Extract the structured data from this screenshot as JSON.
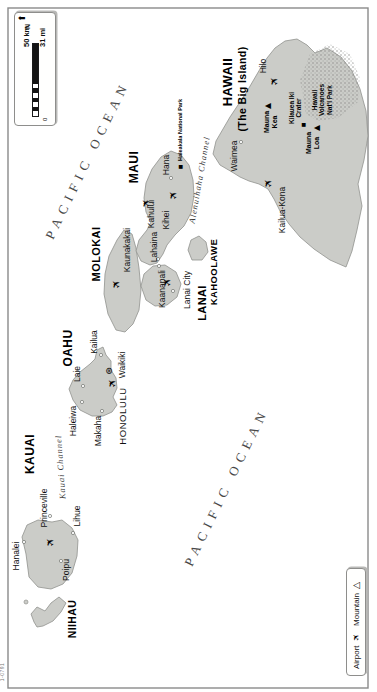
{
  "map": {
    "code": "1-0791",
    "island_fill": "#cbccc8",
    "island_stroke": "#90928e",
    "frame": {
      "x": 4,
      "y": 8,
      "w": 680,
      "h": 360
    },
    "scalebar": {
      "x": 566,
      "y": 14,
      "w": 114,
      "h": 42,
      "km": "50 km",
      "mi": "31 mi",
      "zero": "0",
      "north": "N",
      "arrow": "➤"
    },
    "legend": {
      "x": 16,
      "y": 346,
      "w": 108,
      "h": 20,
      "airport_label": "Airport",
      "airport_glyph": "✈",
      "mountain_label": "Mountain",
      "mountain_glyph": "△"
    },
    "islands": [
      {
        "name": "niihau",
        "points": "70,34 78,31 85,37 81,45 89,51 95,59 89,66 80,61 71,53 66,43 65,37"
      },
      {
        "name": "kauai",
        "points": "138,26 155,22 167,27 172,38 170,52 172,62 164,72 152,78 136,77 119,72 108,63 103,51 105,38 115,29"
      },
      {
        "name": "oahu",
        "points": "276,92 282,80 292,73 303,69 312,73 320,80 328,90 333,95 342,97 345,103 337,106 331,111 322,111 314,116 304,117 295,113 287,117 280,112 276,103"
      },
      {
        "name": "molokai",
        "points": "362,116 378,108 398,104 418,105 436,109 452,117 462,124 458,132 444,136 424,139 402,141 382,139 368,133 360,125"
      },
      {
        "name": "lanai",
        "points": "392,146 406,141 418,144 426,153 427,165 420,176 408,181 395,177 387,167 386,155"
      },
      {
        "name": "kahoolawe",
        "points": "432,192 442,188 452,191 456,199 450,206 440,208 432,202"
      },
      {
        "name": "maui",
        "points": "427,150 431,141 441,136 452,139 462,147 470,151 480,146 494,144 509,146 523,152 535,161 541,171 537,181 527,189 512,193 496,194 479,191 466,184 457,175 447,167 438,163 429,157"
      },
      {
        "name": "hawaii-big-island",
        "points": "520,232 527,220 538,213 551,216 563,223 575,230 587,238 599,246 611,253 623,260 634,267 644,275 651,285 653,297 647,307 639,315 644,327 635,341 621,352 603,360 581,366 556,368 532,364 508,358 486,362 462,357 441,352 425,346 432,330 443,314 455,300 468,289 481,280 493,274 503,268 508,259 511,249 515,240"
      }
    ],
    "park_area": {
      "name": "volcanoes-park-area",
      "points": "578,306 612,300 638,310 648,330 638,350 614,360 590,358 574,338 571,318"
    },
    "labels": [
      {
        "name": "pacific-ocean-north",
        "text": "PACIFIC OCEAN",
        "x": 532,
        "y": 88,
        "cls": "ocean",
        "rot": 26
      },
      {
        "name": "pacific-ocean-south",
        "text": "PACIFIC OCEAN",
        "x": 205,
        "y": 227,
        "cls": "ocean",
        "rot": 26
      },
      {
        "name": "kauai-channel",
        "text": "Kauai Channel",
        "x": 225,
        "y": 61,
        "cls": "channel",
        "rot": -4
      },
      {
        "name": "alenuihaha-channel",
        "text": "Alenuihaha Channel",
        "x": 512,
        "y": 200,
        "cls": "channel",
        "rot": 10
      },
      {
        "name": "hawaii-name",
        "text": "HAWAII",
        "x": 610,
        "y": 228,
        "cls": "island-name",
        "size": 13
      },
      {
        "name": "big-island-subtitle",
        "text": "(The Big Island)",
        "x": 603,
        "y": 243,
        "cls": "island-name",
        "size": 10.5
      },
      {
        "name": "maui-name",
        "text": "MAUI",
        "x": 525,
        "y": 135,
        "cls": "island-name",
        "size": 12
      },
      {
        "name": "molokai-name",
        "text": "MOLOKAI",
        "x": 438,
        "y": 96,
        "cls": "island-name",
        "size": 11
      },
      {
        "name": "lanai-name",
        "text": "LANAI",
        "x": 389,
        "y": 202,
        "cls": "island-name",
        "size": 11
      },
      {
        "name": "kahoolawe-name",
        "text": "KAHOOLAWE",
        "x": 420,
        "y": 214,
        "cls": "island-name",
        "size": 9.5
      },
      {
        "name": "oahu-name",
        "text": "OAHU",
        "x": 344,
        "y": 69,
        "cls": "island-name",
        "size": 12
      },
      {
        "name": "kauai-name",
        "text": "KAUAI",
        "x": 238,
        "y": 31,
        "cls": "island-name",
        "size": 12
      },
      {
        "name": "niihau-name",
        "text": "NIIHAU",
        "x": 73,
        "y": 73,
        "cls": "island-name",
        "size": 10.5
      },
      {
        "name": "hilo",
        "text": "Hilo",
        "x": 626,
        "y": 264,
        "cls": "town"
      },
      {
        "name": "waimea",
        "text": "Waimea",
        "x": 536,
        "y": 235,
        "cls": "town"
      },
      {
        "name": "kailua-kona",
        "text": "Kailua-Kona",
        "x": 482,
        "y": 283,
        "cls": "town"
      },
      {
        "name": "mauna-kea",
        "text": "Mauna\nKea",
        "x": 570,
        "y": 271,
        "cls": "small-bold",
        "size": 7
      },
      {
        "name": "mauna-loa",
        "text": "Mauna\nLoa",
        "x": 549,
        "y": 313,
        "cls": "small-bold",
        "size": 7
      },
      {
        "name": "kilauea-iki-crater",
        "text": "Kilauea Iki\nCrater",
        "x": 584,
        "y": 295,
        "cls": "small-bold",
        "size": 6.5
      },
      {
        "name": "volcanoes-park",
        "text": "Hawaii\nVolcanoes\nNat'l Park",
        "x": 592,
        "y": 322,
        "cls": "small-bold",
        "size": 6.5
      },
      {
        "name": "hana",
        "text": "Hana",
        "x": 527,
        "y": 167,
        "cls": "town"
      },
      {
        "name": "haleakala-park",
        "text": "Haleakala National Park",
        "x": 531,
        "y": 180,
        "cls": "small-bold",
        "size": 5.5,
        "anchor": "left"
      },
      {
        "name": "kahului",
        "text": "Kahului",
        "x": 478,
        "y": 152,
        "cls": "town"
      },
      {
        "name": "kihei",
        "text": "Kihei",
        "x": 472,
        "y": 167,
        "cls": "town"
      },
      {
        "name": "lahaina",
        "text": "Lahaina",
        "x": 445,
        "y": 155,
        "cls": "town"
      },
      {
        "name": "kaanapali",
        "text": "Kaanapali",
        "x": 403,
        "y": 163,
        "cls": "town"
      },
      {
        "name": "kaunakakai",
        "text": "Kaunakakai",
        "x": 442,
        "y": 128,
        "cls": "town"
      },
      {
        "name": "lanai-city",
        "text": "Lanai City",
        "x": 402,
        "y": 188,
        "cls": "town"
      },
      {
        "name": "honolulu",
        "text": "HONOLULU",
        "x": 276,
        "y": 123,
        "cls": "city-caps"
      },
      {
        "name": "waikiki",
        "text": "Waikiki",
        "x": 327,
        "y": 123,
        "cls": "town"
      },
      {
        "name": "kailua",
        "text": "Kailua",
        "x": 350,
        "y": 95,
        "cls": "town"
      },
      {
        "name": "laie",
        "text": "Laie",
        "x": 318,
        "y": 78,
        "cls": "town"
      },
      {
        "name": "haleiwa",
        "text": "Haleiwa",
        "x": 271,
        "y": 74,
        "cls": "town"
      },
      {
        "name": "makaha",
        "text": "Makaha",
        "x": 261,
        "y": 99,
        "cls": "town"
      },
      {
        "name": "hanalei",
        "text": "Hanalei",
        "x": 136,
        "y": 17,
        "cls": "town"
      },
      {
        "name": "princeville",
        "text": "Princeville",
        "x": 184,
        "y": 45,
        "cls": "town"
      },
      {
        "name": "lihue",
        "text": "Lihue",
        "x": 176,
        "y": 78,
        "cls": "town"
      },
      {
        "name": "poipu",
        "text": "Poipu",
        "x": 122,
        "y": 67,
        "cls": "town"
      },
      {
        "name": "map-code",
        "text": "1-0791",
        "x": 20,
        "y": 3,
        "cls": "tiny"
      }
    ],
    "markers": [
      {
        "type": "airport",
        "name": "lihue-airport",
        "glyph": "✈",
        "x": 150,
        "y": 50
      },
      {
        "type": "airport",
        "name": "honolulu-airport",
        "glyph": "✈",
        "x": 309,
        "y": 112
      },
      {
        "type": "airport",
        "name": "molokai-airport",
        "glyph": "✈",
        "x": 408,
        "y": 116
      },
      {
        "type": "airport",
        "name": "lanai-airport",
        "glyph": "✈",
        "x": 410,
        "y": 167
      },
      {
        "type": "airport",
        "name": "kahului-airport",
        "glyph": "✈",
        "x": 489,
        "y": 146
      },
      {
        "type": "airport",
        "name": "hana-airport",
        "glyph": "✈",
        "x": 497,
        "y": 173
      },
      {
        "type": "airport",
        "name": "kona-airport",
        "glyph": "✈",
        "x": 509,
        "y": 268
      },
      {
        "type": "airport",
        "name": "hilo-airport",
        "glyph": "✈",
        "x": 611,
        "y": 274
      },
      {
        "type": "capital",
        "name": "honolulu-capital-star",
        "glyph": "⊛",
        "x": 321,
        "y": 109
      },
      {
        "type": "mountain",
        "name": "mauna-kea-peak",
        "glyph": "▲",
        "x": 586,
        "y": 268
      },
      {
        "type": "mountain",
        "name": "mauna-loa-peak",
        "glyph": "▲",
        "x": 564,
        "y": 317
      },
      {
        "type": "park",
        "name": "kilauea-marker",
        "glyph": "■",
        "x": 567,
        "y": 303
      },
      {
        "type": "park",
        "name": "haleakala-marker",
        "glyph": "■",
        "x": 525,
        "y": 180
      }
    ],
    "towns": [
      {
        "name": "hanalei-dot",
        "x": 150,
        "y": 24
      },
      {
        "name": "princeville-dot",
        "x": 176,
        "y": 50
      },
      {
        "name": "lihue-dot",
        "x": 159,
        "y": 73
      },
      {
        "name": "poipu-dot",
        "x": 131,
        "y": 61
      },
      {
        "name": "haleiwa-dot",
        "x": 290,
        "y": 82
      },
      {
        "name": "makaha-dot",
        "x": 281,
        "y": 102
      },
      {
        "name": "laie-dot",
        "x": 306,
        "y": 83
      },
      {
        "name": "kailua-dot",
        "x": 337,
        "y": 101
      },
      {
        "name": "waimea-dot",
        "x": 550,
        "y": 241
      },
      {
        "name": "lahaina-dot",
        "x": 433,
        "y": 158
      },
      {
        "name": "kaanapali-dot",
        "x": 426,
        "y": 159
      },
      {
        "name": "lanai-city-dot",
        "x": 401,
        "y": 173
      },
      {
        "name": "hana-dot",
        "x": 514,
        "y": 171
      }
    ],
    "islet": {
      "name": "lehua-islet",
      "x": 90,
      "y": 26,
      "r": 2
    }
  }
}
